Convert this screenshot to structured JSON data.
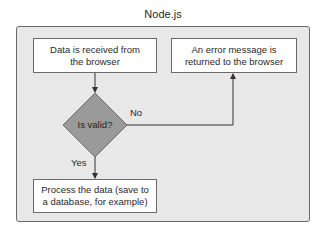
{
  "title": "Node.js",
  "nodes": {
    "receive": "Data is received from the browser",
    "error": "An error message is returned to the browser",
    "decision": "Is valid?",
    "process": "Process the data (save to a database, for example)"
  },
  "edges": {
    "no_label": "No",
    "yes_label": "Yes"
  },
  "colors": {
    "container_fill": "#e8e8e8",
    "diamond_fill": "#9a9a9a",
    "border": "#6a6a6a"
  }
}
